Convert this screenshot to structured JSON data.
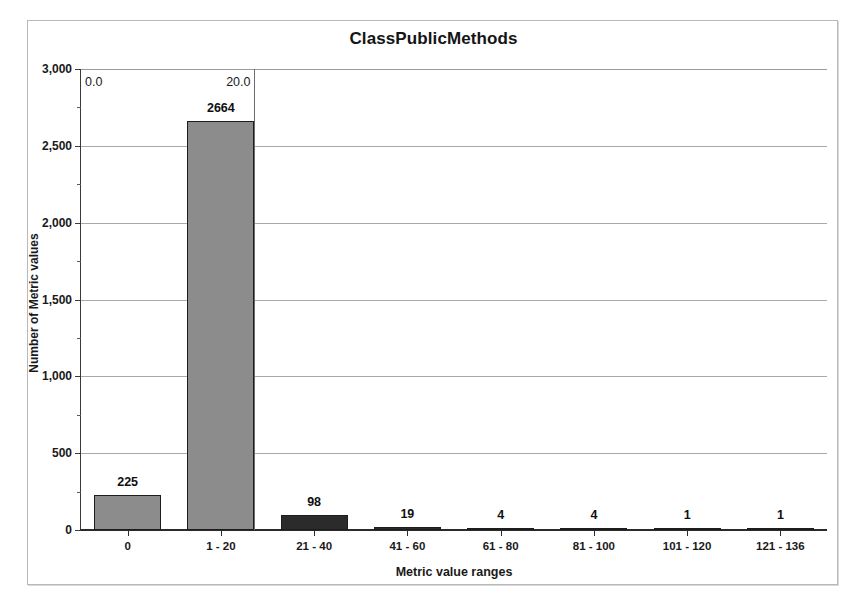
{
  "chart_data": {
    "type": "bar",
    "title": "ClassPublicMethods",
    "xlabel": "Metric value ranges",
    "ylabel": "Number of Metric values",
    "categories": [
      "0",
      "1 - 20",
      "21 - 40",
      "41 - 60",
      "61 - 80",
      "81 - 100",
      "101 - 120",
      "121 - 136"
    ],
    "values": [
      225,
      2664,
      98,
      19,
      4,
      4,
      1,
      1
    ],
    "value_labels": [
      "225",
      "2664",
      "98",
      "19",
      "4",
      "4",
      "1",
      "1"
    ],
    "ylim": [
      0,
      3000
    ],
    "ytick_values": [
      0,
      500,
      1000,
      1500,
      2000,
      2500,
      3000
    ],
    "ytick_labels": [
      "0",
      "500",
      "1,000",
      "1,500",
      "2,000",
      "2,500",
      "3,000"
    ],
    "yminor_values": [
      250,
      750,
      1250,
      1750,
      2250,
      2750
    ],
    "grid": true,
    "legend": "none",
    "bar_colors": [
      "#8c8c8c",
      "#8c8c8c",
      "#2b2b2b",
      "#2b2b2b",
      "#2b2b2b",
      "#2b2b2b",
      "#2b2b2b",
      "#2b2b2b"
    ],
    "annotations": [
      {
        "text": "0.0",
        "value": 0.0,
        "align": "left"
      },
      {
        "text": "20.0",
        "value": 20.0,
        "align": "right"
      }
    ]
  },
  "colors": {
    "bar_light": "#8c8c8c",
    "bar_dark": "#2b2b2b",
    "bar_border": "#1d1d1d",
    "gridline": "#a9a9a9",
    "axis": "#2b2b2b",
    "frame_border": "#b9b9b9",
    "marker_line": "#6d6d6d",
    "background": "#ffffff",
    "text": "#1a1a1a"
  }
}
